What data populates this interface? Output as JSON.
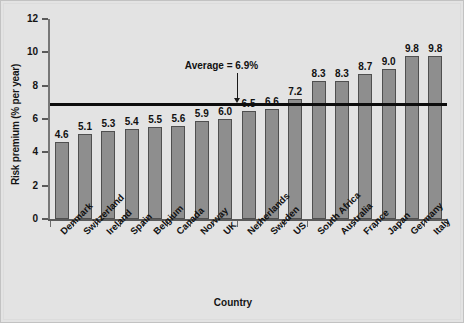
{
  "chart_data": {
    "type": "bar",
    "title": "",
    "xlabel": "Country",
    "ylabel": "Risk premium (% per year)",
    "categories": [
      "Denmark",
      "Switzerland",
      "Ireland",
      "Spain",
      "Belgium",
      "Canada",
      "Norway",
      "UK",
      "Netherlands",
      "Sweden",
      "US",
      "South Africa",
      "Australia",
      "France",
      "Japan",
      "Germany",
      "Italy"
    ],
    "values": [
      4.6,
      5.1,
      5.3,
      5.4,
      5.5,
      5.6,
      5.9,
      6.0,
      6.5,
      6.6,
      7.2,
      8.3,
      8.3,
      8.7,
      9.0,
      9.8,
      9.8
    ],
    "value_labels": [
      "4.6",
      "5.1",
      "5.3",
      "5.4",
      "5.5",
      "5.6",
      "5.9",
      "6.0",
      "6.5",
      "6.6",
      "7.2",
      "8.3",
      "8.3",
      "8.7",
      "9.0",
      "9.8",
      "9.8"
    ],
    "ylim": [
      0,
      12
    ],
    "ytick_labels": [
      "0",
      "2",
      "4",
      "6",
      "8",
      "10",
      "12"
    ],
    "ytick_values": [
      0,
      2,
      4,
      6,
      8,
      10,
      12
    ],
    "grid": false,
    "legend": "none",
    "annotations": [
      {
        "name": "average-reference",
        "label": "Average = 6.9%",
        "value": 6.9
      }
    ],
    "colors": {
      "bar_fill": "#8e8e8e",
      "bar_edge": "#4f4f4f",
      "average_line": "#0d0d0d",
      "background": "#e3e3e3",
      "axis": "#5a5a5a",
      "text": "#111111"
    }
  }
}
